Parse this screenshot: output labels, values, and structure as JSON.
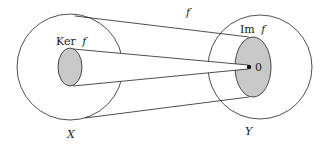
{
  "diagram": {
    "type": "set-mapping",
    "map_label": "f",
    "domain": {
      "label": "X",
      "subset_label": "Ker",
      "subset_fn": "f"
    },
    "codomain": {
      "label": "Y",
      "subset_label": "Im",
      "subset_fn": "f",
      "point_label": "0"
    },
    "colors": {
      "stroke": "#222222",
      "fill_shaded": "#c8c8c8",
      "background": "#ffffff"
    }
  }
}
